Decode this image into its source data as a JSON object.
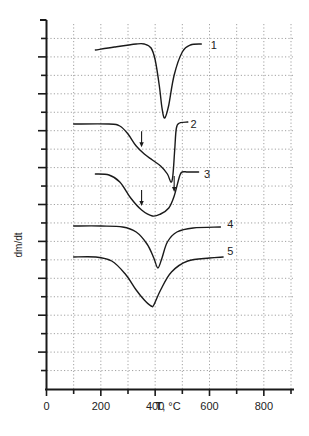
{
  "chart_data": {
    "type": "line",
    "title": "",
    "xlabel": "T, °C",
    "ylabel": "dm/dt",
    "xlim": [
      0,
      900
    ],
    "x_ticks": [
      0,
      200,
      400,
      600,
      800
    ],
    "x_minor_ticks": [
      100,
      300,
      500,
      700,
      900
    ],
    "y_ticks_labeled": false,
    "grid": true,
    "legend_position": "inline labels at right end of each curve",
    "series": [
      {
        "name": "1",
        "offset_note": "top curve",
        "x": [
          180,
          250,
          330,
          360,
          385,
          400,
          415,
          425,
          435,
          450,
          470,
          500,
          530,
          570
        ],
        "y_px": [
          50,
          47,
          44,
          44,
          48,
          60,
          85,
          108,
          118,
          105,
          75,
          52,
          45,
          44
        ],
        "peak_T": 430
      },
      {
        "name": "2",
        "x": [
          100,
          230,
          270,
          300,
          330,
          360,
          390,
          420,
          445,
          458,
          465,
          472,
          478,
          490,
          520
        ],
        "y_px": [
          124,
          124,
          126,
          134,
          146,
          154,
          160,
          166,
          174,
          182,
          176,
          150,
          128,
          123,
          122
        ],
        "peak_T": 460,
        "arrows_T": [
          350
        ]
      },
      {
        "name": "3",
        "x": [
          180,
          230,
          270,
          310,
          350,
          390,
          420,
          450,
          470,
          490,
          500,
          520,
          560
        ],
        "y_px": [
          174,
          175,
          182,
          198,
          210,
          216,
          214,
          208,
          196,
          176,
          172,
          172,
          172
        ],
        "peak_T": 400,
        "arrows_T": [
          350,
          470
        ]
      },
      {
        "name": "4",
        "x": [
          100,
          200,
          280,
          330,
          370,
          395,
          410,
          425,
          445,
          480,
          540,
          640
        ],
        "y_px": [
          226,
          226,
          227,
          232,
          244,
          258,
          268,
          258,
          242,
          232,
          228,
          227
        ],
        "peak_T": 415
      },
      {
        "name": "5",
        "x": [
          100,
          180,
          240,
          290,
          330,
          360,
          385,
          395,
          420,
          460,
          520,
          600,
          650
        ],
        "y_px": [
          257,
          257,
          261,
          274,
          290,
          300,
          306,
          305,
          290,
          272,
          261,
          258,
          257
        ],
        "peak_T": 390
      }
    ],
    "curve_labels": [
      {
        "text": "1",
        "T": 605,
        "y_px": 45
      },
      {
        "text": "2",
        "T": 530,
        "y_px": 124
      },
      {
        "text": "3",
        "T": 580,
        "y_px": 174
      },
      {
        "text": "4",
        "T": 665,
        "y_px": 224
      },
      {
        "text": "5",
        "T": 665,
        "y_px": 251
      }
    ]
  }
}
